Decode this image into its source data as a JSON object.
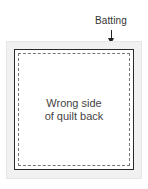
{
  "diagram": {
    "labels": {
      "batting": "Batting",
      "caption_line1": "Wrong side",
      "caption_line2": "of quilt back"
    },
    "colors": {
      "batting_fill": "#f1f1f1",
      "quilt_border": "#2a2a2a",
      "stitch_line": "#777777",
      "text": "#444444"
    }
  }
}
